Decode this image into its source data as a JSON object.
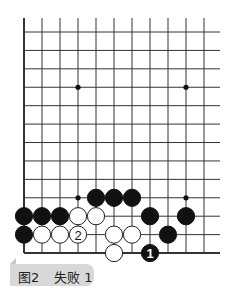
{
  "diagram": {
    "title": "图2  失败 1",
    "caption": {
      "figure": "图2",
      "label": "失败 1"
    },
    "board": {
      "columns": 11,
      "rows": 13,
      "left_edge": true,
      "bottom_edge": true,
      "origin_x": 24,
      "origin_y": 32,
      "dx": 18,
      "dy": 18.42,
      "right_extension": 16,
      "star_points": [
        [
          3,
          3
        ],
        [
          9,
          3
        ],
        [
          3,
          9
        ],
        [
          9,
          9
        ]
      ],
      "stones": [
        {
          "c": 4,
          "r": 9,
          "color": "black"
        },
        {
          "c": 5,
          "r": 9,
          "color": "black"
        },
        {
          "c": 6,
          "r": 9,
          "color": "black"
        },
        {
          "c": 0,
          "r": 10,
          "color": "black"
        },
        {
          "c": 1,
          "r": 10,
          "color": "black"
        },
        {
          "c": 2,
          "r": 10,
          "color": "black"
        },
        {
          "c": 3,
          "r": 10,
          "color": "white"
        },
        {
          "c": 4,
          "r": 10,
          "color": "white"
        },
        {
          "c": 7,
          "r": 10,
          "color": "black"
        },
        {
          "c": 9,
          "r": 10,
          "color": "black"
        },
        {
          "c": 0,
          "r": 11,
          "color": "black"
        },
        {
          "c": 1,
          "r": 11,
          "color": "white"
        },
        {
          "c": 2,
          "r": 11,
          "color": "white"
        },
        {
          "c": 3,
          "r": 11,
          "color": "white",
          "label": "2"
        },
        {
          "c": 5,
          "r": 11,
          "color": "white"
        },
        {
          "c": 6,
          "r": 11,
          "color": "white"
        },
        {
          "c": 8,
          "r": 11,
          "color": "black"
        },
        {
          "c": 5,
          "r": 12,
          "color": "white"
        },
        {
          "c": 7,
          "r": 12,
          "color": "black",
          "label": "1"
        }
      ]
    },
    "colors": {
      "line": "#333333",
      "black_stone": "#111111",
      "white_stone": "#ffffff",
      "caption_bg": "#d8d8d8"
    }
  }
}
